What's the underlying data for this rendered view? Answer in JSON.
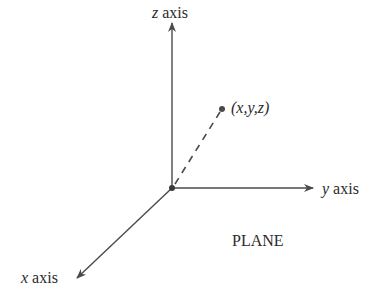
{
  "labels": {
    "z_axis_var": "z",
    "z_axis_word": "axis",
    "y_axis_var": "y",
    "y_axis_word": "axis",
    "x_axis_var": "x",
    "x_axis_word": "axis",
    "point": "(x,y,z)",
    "plane": "PLANE"
  },
  "colors": {
    "stroke": "#4a4a4a",
    "text": "#2a2a2a",
    "background": "#ffffff"
  },
  "geometry": {
    "origin": [
      172,
      188
    ],
    "z_axis_end": [
      172,
      22
    ],
    "y_axis_end": [
      314,
      188
    ],
    "x_axis_end": [
      76,
      279
    ],
    "point": [
      222,
      109
    ]
  }
}
